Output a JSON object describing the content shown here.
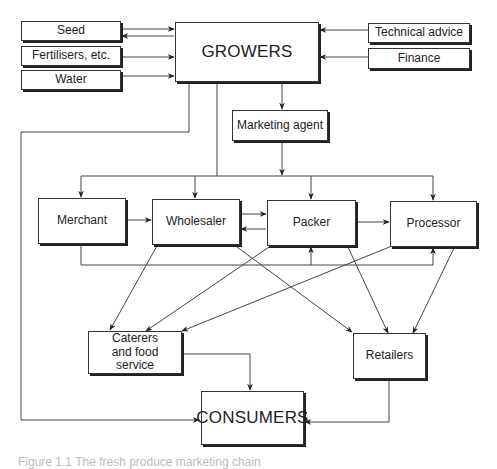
{
  "diagram": {
    "inputs": [
      {
        "id": "seed",
        "label": "Seed"
      },
      {
        "id": "fertilisers",
        "label": "Fertilisers, etc."
      },
      {
        "id": "water",
        "label": "Water"
      }
    ],
    "support": [
      {
        "id": "technical-advice",
        "label": "Technical advice"
      },
      {
        "id": "finance",
        "label": "Finance"
      }
    ],
    "growers": {
      "label": "GROWERS"
    },
    "marketing_agent": {
      "label": "Marketing agent"
    },
    "intermediaries": [
      {
        "id": "merchant",
        "label": "Merchant"
      },
      {
        "id": "wholesaler",
        "label": "Wholesaler"
      },
      {
        "id": "packer",
        "label": "Packer"
      },
      {
        "id": "processor",
        "label": "Processor"
      }
    ],
    "caterers": {
      "label": "Caterers and food service",
      "lines": [
        "Caterers",
        "and food",
        "service"
      ]
    },
    "retailers": {
      "label": "Retailers"
    },
    "consumers": {
      "label": "CONSUMERS"
    },
    "caption": "Figure 1.1  The fresh produce marketing chain",
    "edges": [
      [
        "Seed",
        "GROWERS"
      ],
      [
        "GROWERS",
        "Seed"
      ],
      [
        "Fertilisers, etc.",
        "GROWERS"
      ],
      [
        "Water",
        "GROWERS"
      ],
      [
        "Technical advice",
        "GROWERS"
      ],
      [
        "Finance",
        "GROWERS"
      ],
      [
        "GROWERS",
        "Marketing agent"
      ],
      [
        "GROWERS",
        "CONSUMERS"
      ],
      [
        "GROWERS",
        "Merchant"
      ],
      [
        "GROWERS",
        "Wholesaler"
      ],
      [
        "GROWERS",
        "Packer"
      ],
      [
        "GROWERS",
        "Processor"
      ],
      [
        "Marketing agent",
        "Merchant"
      ],
      [
        "Marketing agent",
        "Wholesaler"
      ],
      [
        "Marketing agent",
        "Packer"
      ],
      [
        "Marketing agent",
        "Processor"
      ],
      [
        "Merchant",
        "Wholesaler"
      ],
      [
        "Wholesaler",
        "Packer"
      ],
      [
        "Packer",
        "Wholesaler"
      ],
      [
        "Packer",
        "Processor"
      ],
      [
        "Merchant",
        "Packer"
      ],
      [
        "Merchant",
        "Processor"
      ],
      [
        "Wholesaler",
        "Caterers and food service"
      ],
      [
        "Wholesaler",
        "Retailers"
      ],
      [
        "Packer",
        "Caterers and food service"
      ],
      [
        "Packer",
        "Retailers"
      ],
      [
        "Processor",
        "Caterers and food service"
      ],
      [
        "Processor",
        "Retailers"
      ],
      [
        "Caterers and food service",
        "CONSUMERS"
      ],
      [
        "Retailers",
        "CONSUMERS"
      ]
    ]
  }
}
